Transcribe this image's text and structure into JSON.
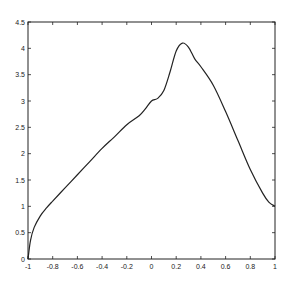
{
  "chart_data": {
    "type": "line",
    "title": "",
    "xlabel": "",
    "ylabel": "",
    "xlim": [
      -1,
      1
    ],
    "ylim": [
      0,
      4.5
    ],
    "grid": false,
    "legend": null,
    "x_ticks": [
      "-1",
      "-0.8",
      "-0.6",
      "-0.4",
      "-0.2",
      "0",
      "0.2",
      "0.4",
      "0.6",
      "0.8",
      "1"
    ],
    "y_ticks": [
      "0",
      "0.5",
      "1",
      "1.5",
      "2",
      "2.5",
      "3",
      "3.5",
      "4",
      "4.5"
    ],
    "series": [
      {
        "name": "curve",
        "color": "#222222",
        "x": [
          -1,
          -0.98,
          -0.95,
          -0.9,
          -0.85,
          -0.8,
          -0.7,
          -0.6,
          -0.5,
          -0.4,
          -0.3,
          -0.2,
          -0.1,
          -0.05,
          0,
          0.05,
          0.1,
          0.15,
          0.2,
          0.25,
          0.3,
          0.35,
          0.4,
          0.5,
          0.6,
          0.7,
          0.8,
          0.9,
          0.95,
          1
        ],
        "y": [
          0,
          0.35,
          0.6,
          0.82,
          0.97,
          1.1,
          1.35,
          1.6,
          1.85,
          2.1,
          2.32,
          2.55,
          2.72,
          2.85,
          3.0,
          3.05,
          3.2,
          3.55,
          3.95,
          4.1,
          4.02,
          3.8,
          3.65,
          3.3,
          2.8,
          2.25,
          1.7,
          1.25,
          1.08,
          1.0
        ]
      }
    ]
  }
}
